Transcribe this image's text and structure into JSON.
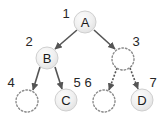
{
  "diagram": {
    "background_color": "#ffffff",
    "canvas": {
      "width": 162,
      "height": 123
    },
    "style": {
      "node_fill": "#efefef",
      "node_stroke": "#c8c8c8",
      "node_text_color": "#1a1a1a",
      "empty_node_stroke": "#8c8c8c",
      "empty_node_fill": "#ffffff",
      "edge_color": "#555555",
      "index_label_color": "#262626",
      "node_radius": 11,
      "empty_node_radius": 11
    },
    "nodes": [
      {
        "id": "n1",
        "index": "1",
        "label": "A",
        "filled": true,
        "cx": 85,
        "cy": 22,
        "index_x": 66,
        "index_y": 13
      },
      {
        "id": "n2",
        "index": "2",
        "label": "B",
        "filled": true,
        "cx": 47,
        "cy": 58,
        "index_x": 29,
        "index_y": 41
      },
      {
        "id": "n3",
        "index": "3",
        "label": "",
        "filled": false,
        "cx": 123,
        "cy": 59,
        "index_x": 136,
        "index_y": 41
      },
      {
        "id": "n4",
        "index": "4",
        "label": "",
        "filled": false,
        "cx": 27,
        "cy": 101,
        "index_x": 11,
        "index_y": 82
      },
      {
        "id": "n5",
        "index": "5",
        "label": "C",
        "filled": true,
        "cx": 66,
        "cy": 100,
        "index_x": 77,
        "index_y": 82
      },
      {
        "id": "n6",
        "index": "6",
        "label": "",
        "filled": false,
        "cx": 104,
        "cy": 101,
        "index_x": 88,
        "index_y": 82
      },
      {
        "id": "n7",
        "index": "7",
        "label": "D",
        "filled": true,
        "cx": 142,
        "cy": 100,
        "index_x": 153,
        "index_y": 82
      }
    ],
    "edges": [
      {
        "id": "e1",
        "from": "n1",
        "to": "n2",
        "x1": 77,
        "y1": 30,
        "x2": 55,
        "y2": 49,
        "dashed": false
      },
      {
        "id": "e2",
        "from": "n1",
        "to": "n3",
        "x1": 94,
        "y1": 30,
        "x2": 115,
        "y2": 49,
        "dashed": false
      },
      {
        "id": "e3",
        "from": "n2",
        "to": "n4",
        "x1": 40,
        "y1": 67,
        "x2": 33,
        "y2": 90,
        "dashed": false
      },
      {
        "id": "e4",
        "from": "n2",
        "to": "n5",
        "x1": 55,
        "y1": 67,
        "x2": 62,
        "y2": 89,
        "dashed": false
      },
      {
        "id": "e5",
        "from": "n3",
        "to": "n6",
        "x1": 117,
        "y1": 68,
        "x2": 109,
        "y2": 90,
        "dashed": true
      },
      {
        "id": "e6",
        "from": "n3",
        "to": "n7",
        "x1": 130,
        "y1": 68,
        "x2": 138,
        "y2": 89,
        "dashed": true
      }
    ]
  }
}
